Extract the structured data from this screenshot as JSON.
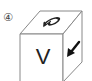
{
  "figure": {
    "option_label": "④",
    "cube": {
      "top_face": {
        "symbol": "curved-arrow-symbol",
        "glyph": "ひ"
      },
      "front_face": {
        "symbol": "letter",
        "glyph": "V"
      },
      "right_face": {
        "symbol": "arrow-down-left"
      }
    },
    "colors": {
      "stroke": "#888888",
      "symbol": "#222222",
      "background": "#ffffff"
    }
  }
}
